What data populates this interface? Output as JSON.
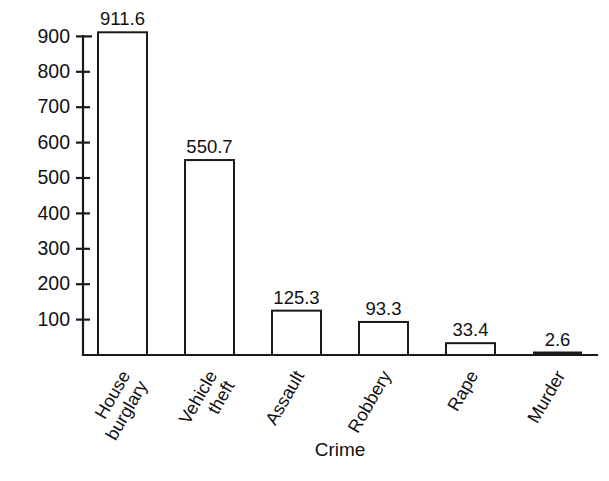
{
  "chart_data": {
    "type": "bar",
    "title": "",
    "xlabel": "Crime",
    "ylabel": "",
    "categories": [
      "House burglary",
      "Vehicle theft",
      "Assault",
      "Robbery",
      "Rape",
      "Murder"
    ],
    "category_lines": [
      [
        "House",
        "burglary"
      ],
      [
        "Vehicle",
        "theft"
      ],
      [
        "Assault"
      ],
      [
        "Robbery"
      ],
      [
        "Rape"
      ],
      [
        "Murder"
      ]
    ],
    "values": [
      911.6,
      550.7,
      125.3,
      93.3,
      33.4,
      2.6
    ],
    "value_labels": [
      "911.6",
      "550.7",
      "125.3",
      "93.3",
      "33.4",
      "2.6"
    ],
    "ytick_labels": [
      "100",
      "200",
      "300",
      "400",
      "500",
      "600",
      "700",
      "800",
      "900"
    ],
    "ytick_values": [
      100,
      200,
      300,
      400,
      500,
      600,
      700,
      800,
      900
    ],
    "ylim": [
      0,
      935
    ],
    "grid": false,
    "legend": false,
    "bar_fill_color": "#ffffff",
    "bar_stroke_color": "#1a1a1a",
    "axis_color": "#1a1a1a",
    "background_color": "#ffffff",
    "category_label_rotation_deg": -60
  }
}
